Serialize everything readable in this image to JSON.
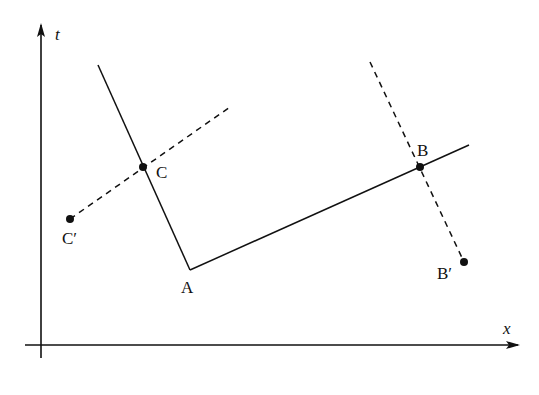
{
  "diagram": {
    "axes": {
      "vertical": {
        "label": "t",
        "x": 41,
        "y_top": 25,
        "y_bottom": 358,
        "label_pos": [
          55,
          40
        ]
      },
      "horizontal": {
        "label": "x",
        "y": 345,
        "x_left": 25,
        "x_right": 518,
        "label_pos": [
          503,
          334
        ]
      }
    },
    "points": {
      "A": {
        "label": "A",
        "x": 190,
        "y": 270,
        "label_pos": [
          181,
          293
        ],
        "dot": false
      },
      "B": {
        "label": "B",
        "x": 420,
        "y": 167,
        "label_pos": [
          417,
          156
        ],
        "dot": true
      },
      "C": {
        "label": "C",
        "x": 143,
        "y": 167,
        "label_pos": [
          156,
          178
        ],
        "dot": true
      },
      "B_prime": {
        "label": "B′",
        "x": 464,
        "y": 262,
        "label_pos": [
          437,
          279
        ],
        "dot": true
      },
      "C_prime": {
        "label": "C′",
        "x": 70,
        "y": 219,
        "label_pos": [
          62,
          244
        ],
        "dot": true
      }
    },
    "solid_lines": [
      {
        "name": "worldline-CA",
        "from": [
          98,
          65
        ],
        "to": [
          190,
          270
        ]
      },
      {
        "name": "worldline-AB",
        "from": [
          190,
          270
        ],
        "to": [
          469,
          145
        ]
      }
    ],
    "dashed_lines": [
      {
        "name": "dashed-through-C",
        "from": [
          70,
          219
        ],
        "to": [
          230,
          107
        ]
      },
      {
        "name": "dashed-through-B",
        "from": [
          370,
          62
        ],
        "to": [
          464,
          262
        ]
      }
    ],
    "colors": {
      "ink": "#111111",
      "background": "#ffffff"
    }
  }
}
